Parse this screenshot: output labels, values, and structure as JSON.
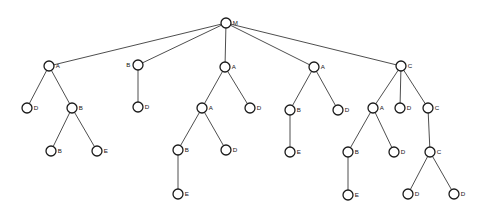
{
  "diagram": {
    "type": "tree",
    "title": "",
    "node_radius": 5,
    "colors": {
      "background": "#ffffff",
      "node_fill": "#ffffff",
      "node_stroke": "#1a1a1a",
      "edge_stroke": "#3a3a3a",
      "label_color": "#141414"
    },
    "nodes": [
      {
        "id": "n0",
        "label": "M",
        "x": 226,
        "y": 23,
        "label_side": "right"
      },
      {
        "id": "n1",
        "label": "A",
        "x": 49,
        "y": 66,
        "label_side": "right"
      },
      {
        "id": "n2",
        "label": "D",
        "x": 27,
        "y": 108,
        "label_side": "right"
      },
      {
        "id": "n3",
        "label": "B",
        "x": 72,
        "y": 108,
        "label_side": "right"
      },
      {
        "id": "n4",
        "label": "B",
        "x": 51,
        "y": 151,
        "label_side": "right"
      },
      {
        "id": "n5",
        "label": "E",
        "x": 97,
        "y": 151,
        "label_side": "right"
      },
      {
        "id": "n6",
        "label": "B",
        "x": 138,
        "y": 65,
        "label_side": "left"
      },
      {
        "id": "n7",
        "label": "D",
        "x": 138,
        "y": 107,
        "label_side": "right"
      },
      {
        "id": "n8",
        "label": "A",
        "x": 225,
        "y": 67,
        "label_side": "right"
      },
      {
        "id": "n9",
        "label": "A",
        "x": 202,
        "y": 108,
        "label_side": "right"
      },
      {
        "id": "n10",
        "label": "D",
        "x": 250,
        "y": 108,
        "label_side": "right"
      },
      {
        "id": "n11",
        "label": "B",
        "x": 178,
        "y": 150,
        "label_side": "right"
      },
      {
        "id": "n12",
        "label": "D",
        "x": 226,
        "y": 150,
        "label_side": "right"
      },
      {
        "id": "n13",
        "label": "E",
        "x": 178,
        "y": 194,
        "label_side": "right"
      },
      {
        "id": "n14",
        "label": "A",
        "x": 314,
        "y": 67,
        "label_side": "right"
      },
      {
        "id": "n15",
        "label": "B",
        "x": 290,
        "y": 110,
        "label_side": "right"
      },
      {
        "id": "n16",
        "label": "D",
        "x": 338,
        "y": 110,
        "label_side": "right"
      },
      {
        "id": "n17",
        "label": "E",
        "x": 290,
        "y": 152,
        "label_side": "right"
      },
      {
        "id": "n18",
        "label": "C",
        "x": 401,
        "y": 66,
        "label_side": "right"
      },
      {
        "id": "n19",
        "label": "A",
        "x": 373,
        "y": 108,
        "label_side": "right"
      },
      {
        "id": "n20",
        "label": "D",
        "x": 400,
        "y": 108,
        "label_side": "right"
      },
      {
        "id": "n21",
        "label": "C",
        "x": 428,
        "y": 108,
        "label_side": "right"
      },
      {
        "id": "n22",
        "label": "B",
        "x": 348,
        "y": 152,
        "label_side": "right"
      },
      {
        "id": "n23",
        "label": "D",
        "x": 394,
        "y": 152,
        "label_side": "right"
      },
      {
        "id": "n24",
        "label": "E",
        "x": 348,
        "y": 195,
        "label_side": "right"
      },
      {
        "id": "n25",
        "label": "C",
        "x": 430,
        "y": 152,
        "label_side": "right"
      },
      {
        "id": "n26",
        "label": "D",
        "x": 408,
        "y": 194,
        "label_side": "right"
      },
      {
        "id": "n27",
        "label": "D",
        "x": 454,
        "y": 194,
        "label_side": "right"
      }
    ],
    "edges": [
      {
        "from": "n0",
        "to": "n1"
      },
      {
        "from": "n0",
        "to": "n6"
      },
      {
        "from": "n0",
        "to": "n8"
      },
      {
        "from": "n0",
        "to": "n14"
      },
      {
        "from": "n0",
        "to": "n18"
      },
      {
        "from": "n1",
        "to": "n2"
      },
      {
        "from": "n1",
        "to": "n3"
      },
      {
        "from": "n3",
        "to": "n4"
      },
      {
        "from": "n3",
        "to": "n5"
      },
      {
        "from": "n6",
        "to": "n7"
      },
      {
        "from": "n8",
        "to": "n9"
      },
      {
        "from": "n8",
        "to": "n10"
      },
      {
        "from": "n9",
        "to": "n11"
      },
      {
        "from": "n9",
        "to": "n12"
      },
      {
        "from": "n11",
        "to": "n13"
      },
      {
        "from": "n14",
        "to": "n15"
      },
      {
        "from": "n14",
        "to": "n16"
      },
      {
        "from": "n15",
        "to": "n17"
      },
      {
        "from": "n18",
        "to": "n19"
      },
      {
        "from": "n18",
        "to": "n20"
      },
      {
        "from": "n18",
        "to": "n21"
      },
      {
        "from": "n19",
        "to": "n22"
      },
      {
        "from": "n19",
        "to": "n23"
      },
      {
        "from": "n22",
        "to": "n24"
      },
      {
        "from": "n21",
        "to": "n25"
      },
      {
        "from": "n25",
        "to": "n26"
      },
      {
        "from": "n25",
        "to": "n27"
      }
    ]
  }
}
